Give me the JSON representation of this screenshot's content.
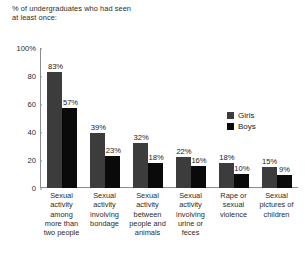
{
  "chart_data": {
    "type": "bar",
    "title": "% of undergraduates who had seen\nat least once:",
    "xlabel": "",
    "ylabel": "",
    "ylim": [
      0,
      100
    ],
    "yticks": [
      "0",
      "20",
      "40",
      "60",
      "80",
      "100%"
    ],
    "ytick_values": [
      0,
      20,
      40,
      60,
      80,
      100
    ],
    "grid": false,
    "legend_position": "right-inside",
    "categories": [
      "Sexual\nactivity\namong\nmore than\ntwo people",
      "Sexual\nactivity\ninvolving\nbondage",
      "Sexual\nactivity\nbetween\npeople and\nanimals",
      "Sexual\nactivity\ninvolving\nurine or\nfeces",
      "Rape or\nsexual\nviolence",
      "Sexual\npictures of\nchildren"
    ],
    "series": [
      {
        "name": "Girls",
        "color": "#3c3c3c",
        "values": [
          83,
          39,
          32,
          22,
          18,
          15
        ],
        "labels": [
          "83%",
          "39%",
          "32%",
          "22%",
          "18%",
          "15%"
        ]
      },
      {
        "name": "Boys",
        "color": "#0a0a0a",
        "values": [
          57,
          23,
          18,
          16,
          10,
          9
        ],
        "labels": [
          "57%",
          "23%",
          "18%",
          "16%",
          "10%",
          "9%"
        ]
      }
    ]
  },
  "legend": {
    "items": [
      {
        "label": "Girls",
        "color": "#3c3c3c"
      },
      {
        "label": "Boys",
        "color": "#0a0a0a"
      }
    ]
  }
}
